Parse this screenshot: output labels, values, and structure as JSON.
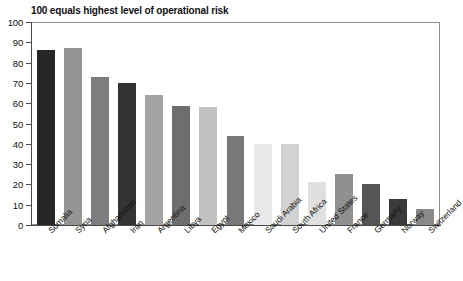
{
  "chart_data": {
    "type": "bar",
    "title": "100 equals highest level of operational risk",
    "xlabel": "",
    "ylabel": "",
    "ylim": [
      0,
      100
    ],
    "yticks": [
      0,
      10,
      20,
      30,
      40,
      50,
      60,
      70,
      80,
      90,
      100
    ],
    "grid": false,
    "legend": "none",
    "categories": [
      "Somalia",
      "Syria",
      "Afghanistan",
      "Iran",
      "Argentina",
      "Libya",
      "Egypt",
      "Mexico",
      "Saudi Arabia",
      "South Africa",
      "United States",
      "France",
      "Germany",
      "Norway",
      "Switzerland"
    ],
    "values": [
      86,
      87,
      73,
      70,
      64,
      58.5,
      58,
      44,
      40,
      40,
      21,
      25,
      20,
      13,
      8
    ],
    "bar_colors": [
      "#262626",
      "#949494",
      "#7d7d7d",
      "#333333",
      "#a3a3a3",
      "#6e6e6e",
      "#c2c2c2",
      "#787878",
      "#e8e8e8",
      "#d2d2d2",
      "#e0e0e0",
      "#909090",
      "#555555",
      "#3a3a3a",
      "#8a8a8a"
    ],
    "axis_color": "#4a4a4a",
    "frame_color": "#8e8e8e",
    "background": "#ffffff",
    "text_color": "#111111"
  }
}
